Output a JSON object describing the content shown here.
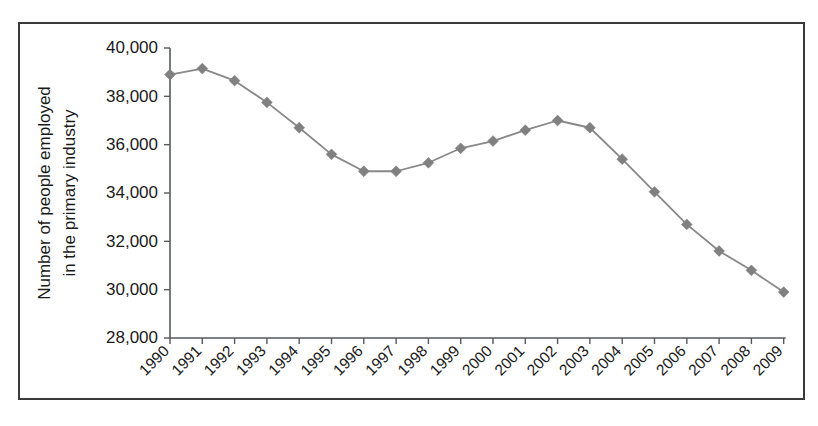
{
  "figure": {
    "name": "primary-industry-employment-chart",
    "background_color": "#ffffff",
    "frame_color": "#3a3a3a"
  },
  "chart_data": {
    "type": "line",
    "title": "",
    "xlabel": "",
    "ylabel": "Number of people employed in the primary industry",
    "ylabel_line1": "Number of people employed",
    "ylabel_line2": "in the primary industry",
    "categories": [
      "1990",
      "1991",
      "1992",
      "1993",
      "1994",
      "1995",
      "1996",
      "1997",
      "1998",
      "1999",
      "2000",
      "2001",
      "2002",
      "2003",
      "2004",
      "2005",
      "2006",
      "2007",
      "2008",
      "2009"
    ],
    "values": [
      38900,
      39150,
      38650,
      37750,
      36700,
      35600,
      34900,
      34900,
      35250,
      35850,
      36150,
      36600,
      37000,
      36700,
      35400,
      34050,
      32700,
      31600,
      30800,
      29900
    ],
    "series": [
      {
        "name": "Number of people employed in the primary industry",
        "values": [
          38900,
          39150,
          38650,
          37750,
          36700,
          35600,
          34900,
          34900,
          35250,
          35850,
          36150,
          36600,
          37000,
          36700,
          35400,
          34050,
          32700,
          31600,
          30800,
          29900
        ],
        "line_color": "#888888",
        "marker_color": "#808080",
        "marker_shape": "diamond"
      }
    ],
    "ylim": [
      28000,
      40000
    ],
    "ytick_values": [
      40000,
      38000,
      36000,
      34000,
      32000,
      30000,
      28000
    ],
    "ytick_labels": [
      "40,000",
      "38,000",
      "36,000",
      "34,000",
      "32,000",
      "30,000",
      "28,000"
    ],
    "xtick_labels": [
      "1990",
      "1991",
      "1992",
      "1993",
      "1994",
      "1995",
      "1996",
      "1997",
      "1998",
      "1999",
      "2000",
      "2001",
      "2002",
      "2003",
      "2004",
      "2005",
      "2006",
      "2007",
      "2008",
      "2009"
    ],
    "xtick_rotation": 45,
    "grid": false,
    "legend": false,
    "legend_position": "none"
  }
}
